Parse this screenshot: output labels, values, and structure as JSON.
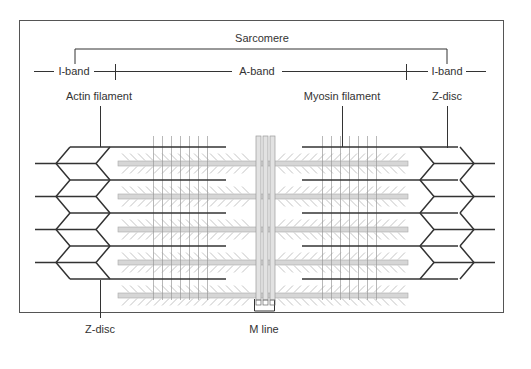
{
  "diagram": {
    "title": "Sarcomere",
    "labels": {
      "sarcomere": "Sarcomere",
      "i_band_left": "I-band",
      "a_band": "A-band",
      "i_band_right": "I-band",
      "actin_filament": "Actin filament",
      "myosin_filament": "Myosin filament",
      "z_disc_top_right": "Z-disc",
      "z_disc_bottom_left": "Z-disc",
      "m_line": "M line"
    },
    "structure": {
      "actin_filaments_per_side": 5,
      "myosin_filaments": 5,
      "z_disc_chevrons_per_side": 4
    },
    "colors": {
      "line": "#333333",
      "myosin": "#d6d6d6",
      "myosin_stroke": "#a9a9a9",
      "head": "#b5b5b5",
      "frame": "#555555"
    }
  }
}
